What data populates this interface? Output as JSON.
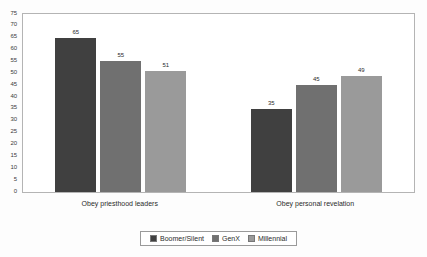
{
  "chart_data": {
    "type": "bar",
    "title": "",
    "subtitle": "",
    "xlabel": "",
    "ylabel": "",
    "ylim": [
      0,
      75
    ],
    "y_ticks": [
      0,
      5,
      10,
      15,
      20,
      25,
      30,
      35,
      40,
      45,
      50,
      55,
      60,
      65,
      70,
      75
    ],
    "grid": false,
    "legend_position": "bottom",
    "categories": [
      "Obey priesthood leaders",
      "Obey personal revelation"
    ],
    "series": [
      {
        "name": "Boomer/Silent",
        "color": "#404040",
        "values": [
          65,
          35
        ]
      },
      {
        "name": "GenX",
        "color": "#707070",
        "values": [
          55,
          45
        ]
      },
      {
        "name": "Millennial",
        "color": "#9a9a9a",
        "values": [
          51,
          49
        ]
      }
    ],
    "data_labels": [
      [
        "65",
        "55",
        "51"
      ],
      [
        "35",
        "45",
        "49"
      ]
    ]
  },
  "colors": {
    "background": "#fdfdfd",
    "plot_background": "#ffffff",
    "plot_border": "#b4b4b4",
    "text": "#2b2b2b",
    "legend_border": "#9a9a9a"
  }
}
